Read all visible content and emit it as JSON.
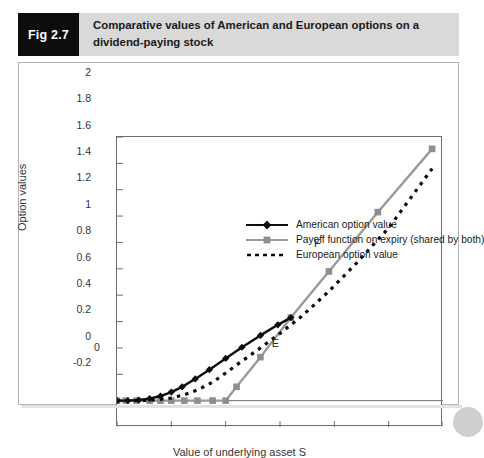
{
  "header": {
    "tag": "Fig 2.7",
    "title": "Comparative values of American and European options on a dividend-paying stock"
  },
  "chart_data": {
    "type": "line",
    "title": "Comparative values of American and European options on a dividend-paying stock",
    "xlabel": "Value of underlying asset S",
    "ylabel": "Option values",
    "xlim": [
      0,
      3
    ],
    "ylim": [
      -0.2,
      2
    ],
    "xticks": [
      "0",
      "0.5",
      "1",
      "1.5",
      "2",
      "2.5",
      "3"
    ],
    "xtick_values": [
      0,
      0.5,
      1,
      1.5,
      2,
      2.5,
      3
    ],
    "yticks": [
      "-0.2",
      "0",
      "0.2",
      "0.4",
      "0.6",
      "0.8",
      "1",
      "1.2",
      "1.4",
      "1.6",
      "1.8",
      "2"
    ],
    "ytick_values": [
      -0.2,
      0,
      0.2,
      0.4,
      0.6,
      0.8,
      1,
      1.2,
      1.4,
      1.6,
      1.8,
      2
    ],
    "grid": false,
    "legend_position": "upper left inside",
    "series": [
      {
        "name": "American option value",
        "color": "#0d0d0d",
        "style": "solid",
        "marker": "diamond",
        "x": [
          0.0,
          0.1,
          0.2,
          0.3,
          0.4,
          0.5,
          0.6,
          0.72,
          0.85,
          1.0,
          1.15,
          1.32,
          1.48,
          1.6
        ],
        "values": [
          0.0,
          0.0,
          0.005,
          0.015,
          0.035,
          0.065,
          0.105,
          0.165,
          0.235,
          0.32,
          0.405,
          0.495,
          0.575,
          0.63
        ]
      },
      {
        "name": "Payoff function on expiry (shared by both)",
        "color": "#9a9a9a",
        "style": "solid",
        "marker": "square",
        "x": [
          0.0,
          0.08,
          0.18,
          0.3,
          0.4,
          0.5,
          0.62,
          0.74,
          0.88,
          1.0,
          1.1,
          1.32,
          1.6,
          1.95,
          2.4,
          2.9
        ],
        "values": [
          0.0,
          0.0,
          0.0,
          0.0,
          0.0,
          0.0,
          0.0,
          0.0,
          0.0,
          0.0,
          0.105,
          0.33,
          0.63,
          0.98,
          1.43,
          1.91
        ]
      },
      {
        "name": "European option value",
        "color": "#0d0d0d",
        "style": "dotted",
        "marker": "none",
        "x": [
          0.0,
          0.2,
          0.35,
          0.5,
          0.62,
          0.75,
          0.88,
          1.0,
          1.15,
          1.32,
          1.5,
          1.7,
          1.95,
          2.2,
          2.5,
          2.9
        ],
        "values": [
          0.0,
          0.0,
          0.005,
          0.02,
          0.045,
          0.085,
          0.14,
          0.21,
          0.3,
          0.4,
          0.51,
          0.64,
          0.83,
          1.04,
          1.31,
          1.76
        ]
      }
    ],
    "annotations": [
      {
        "label": "F",
        "x": 1.85,
        "y": 1.18
      },
      {
        "label": "E",
        "x": 1.46,
        "y": 0.42
      }
    ]
  }
}
